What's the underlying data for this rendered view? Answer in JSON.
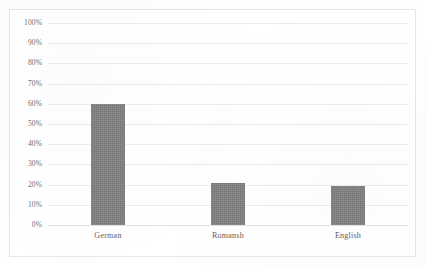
{
  "document": {
    "top_cut_text": "· · ·  · ·   · · ·   · ·    · · ·   · ·"
  },
  "colors": {
    "bar_fill": "#818183",
    "gridline": "#ececf0",
    "frame_border": "#e6e6e8",
    "tick_text": "#6f6f72",
    "category_text": "#5d5d60",
    "background": "#ffffff"
  },
  "chart_data": {
    "type": "bar",
    "title": "",
    "subtitle": "",
    "xlabel": "",
    "ylabel": "",
    "categories": [
      "German",
      "Romansh",
      "English"
    ],
    "values": [
      60,
      21,
      19.5
    ],
    "value_labels": [
      "60%",
      "21%",
      "19.5%"
    ],
    "ylim": [
      0,
      100
    ],
    "ytick_values": [
      100,
      90,
      80,
      70,
      60,
      50,
      40,
      30,
      20,
      10,
      0
    ],
    "ytick_labels": [
      "100%",
      "90%",
      "80%",
      "70%",
      "60%",
      "50%",
      "40%",
      "30%",
      "20%",
      "10%",
      "0%"
    ],
    "grid": true,
    "grid_axis": "y",
    "legend": false,
    "legend_position": "none",
    "series": [
      {
        "name": "Share",
        "values": [
          60,
          21,
          19.5
        ]
      }
    ]
  }
}
